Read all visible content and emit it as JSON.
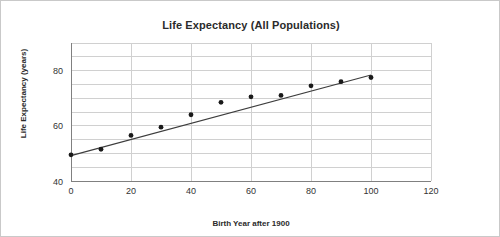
{
  "chart_data": {
    "type": "scatter",
    "title": "Life Expectancy (All Populations)",
    "xlabel": "Birth Year after 1900",
    "ylabel": "Life Expectancy (years)",
    "x": [
      0,
      10,
      20,
      30,
      40,
      50,
      60,
      70,
      80,
      90,
      100
    ],
    "values": [
      49.5,
      51.5,
      56.5,
      59.5,
      64,
      68.5,
      70.5,
      71,
      74.5,
      76,
      77.5
    ],
    "xlim": [
      0,
      120
    ],
    "ylim": [
      40,
      90
    ],
    "xticks": [
      0,
      20,
      40,
      60,
      80,
      100,
      120
    ],
    "yticks": [
      40,
      60,
      80
    ],
    "minor_y_gridlines": true,
    "grid": true,
    "legend": "none",
    "trendline": {
      "visible": true,
      "x_start": 0,
      "y_start": 49.2,
      "x_end": 100,
      "y_end": 78.4
    },
    "marker_color": "#1a1a1a",
    "line_color": "#3d3d3d",
    "grid_color": "#d0d0d0",
    "axis_color": "#808080"
  },
  "axis_text": {
    "x_ticks": [
      "0",
      "20",
      "40",
      "60",
      "80",
      "100",
      "120"
    ],
    "y_ticks": [
      "40",
      "60",
      "80"
    ]
  }
}
